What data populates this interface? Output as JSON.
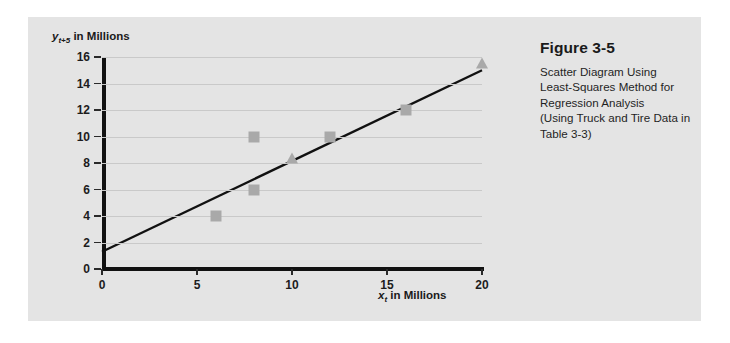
{
  "figure": {
    "title": "Figure 3-5",
    "caption_lines": [
      "Scatter Diagram Using",
      "Least-Squares Method for",
      "Regression Analysis",
      "(Using Truck and Tire Data in",
      "Table 3-3)"
    ]
  },
  "axis_titles": {
    "y_prefix": "y",
    "y_subscript": "t+5",
    "y_suffix": " in Millions",
    "x_prefix": "x",
    "x_subscript": "t",
    "x_suffix": " in Millions"
  },
  "colors": {
    "panel_background": "#e4e4e4",
    "marker": "#a9a9a9",
    "line": "#111111",
    "gridline": "#c9c9c9",
    "axis": "#111111",
    "text": "#1a1a1a"
  },
  "chart_data": {
    "type": "scatter",
    "title": "Scatter Diagram Using Least-Squares Method for Regression Analysis",
    "xlabel": "x_t in Millions",
    "ylabel": "y_t+5 in Millions",
    "xlim": [
      0,
      20
    ],
    "ylim": [
      0,
      16
    ],
    "xticks": [
      0,
      5,
      10,
      15,
      20
    ],
    "yticks": [
      0,
      2,
      4,
      6,
      8,
      10,
      12,
      14,
      16
    ],
    "xtick_labels": [
      "0",
      "5",
      "10",
      "15",
      "20"
    ],
    "ytick_labels": [
      "0",
      "2",
      "4",
      "6",
      "8",
      "10",
      "12",
      "14",
      "16"
    ],
    "grid": "horizontal",
    "legend": "none",
    "series": [
      {
        "name": "Observed data (squares)",
        "marker": "square",
        "color": "#a9a9a9",
        "points": [
          {
            "x": 6,
            "y": 4
          },
          {
            "x": 8,
            "y": 10
          },
          {
            "x": 8,
            "y": 6
          },
          {
            "x": 12,
            "y": 10
          },
          {
            "x": 16,
            "y": 12
          }
        ]
      },
      {
        "name": "Forecast points (triangles)",
        "marker": "triangle",
        "color": "#a9a9a9",
        "points": [
          {
            "x": 10,
            "y": 8.3
          },
          {
            "x": 20,
            "y": 15.5
          }
        ]
      },
      {
        "name": "Least-squares regression line",
        "marker": "line",
        "color": "#111111",
        "points": [
          {
            "x": 0,
            "y": 1.3
          },
          {
            "x": 20,
            "y": 15.0
          }
        ]
      }
    ]
  }
}
